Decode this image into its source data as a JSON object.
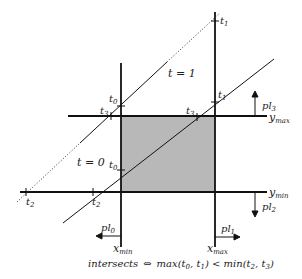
{
  "diagram": {
    "clip_region": {
      "x_min_label": "x",
      "x_min_sub": "min",
      "x_max_label": "x",
      "x_max_sub": "max",
      "y_min_label": "y",
      "y_min_sub": "min",
      "y_max_label": "y",
      "y_max_sub": "max",
      "fill_color": "#b8b8b8"
    },
    "planes": [
      {
        "label": "pl",
        "sub": "0",
        "direction": "left"
      },
      {
        "label": "pl",
        "sub": "1",
        "direction": "right"
      },
      {
        "label": "pl",
        "sub": "2",
        "direction": "down"
      },
      {
        "label": "pl",
        "sub": "3",
        "direction": "up"
      }
    ],
    "line_outside": {
      "param_labels": {
        "t1": "t=1"
      },
      "intersections": [
        {
          "label": "t",
          "sub": "2"
        },
        {
          "label": "t",
          "sub": "3"
        },
        {
          "label": "t",
          "sub": "0"
        },
        {
          "label": "t",
          "sub": "1"
        }
      ]
    },
    "line_inside": {
      "param_labels": {
        "t0": "t=0"
      },
      "intersections": [
        {
          "label": "t",
          "sub": "2"
        },
        {
          "label": "t",
          "sub": "0"
        },
        {
          "label": "t",
          "sub": "3"
        },
        {
          "label": "t",
          "sub": "1"
        }
      ]
    },
    "t_equals_1": "t = 1",
    "t_equals_0": "t = 0",
    "formula": {
      "lhs": "intersects",
      "op": "⇔",
      "rhs": "max(t",
      "rhs_full": "max(t0, t1) < min(t2, t3)"
    }
  }
}
